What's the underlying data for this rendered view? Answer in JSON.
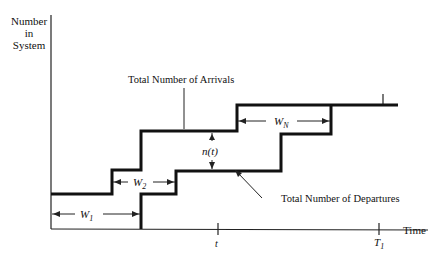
{
  "diagram": {
    "y_axis_label": [
      "Number",
      "in",
      "System"
    ],
    "x_axis_label": "Time",
    "arrivals_label": "Total Number of Arrivals",
    "departures_label": "Total Number of Departures",
    "n_label": "n(t)",
    "w1": "W",
    "w1_sub": "1",
    "w2": "W",
    "w2_sub": "2",
    "wn": "W",
    "wn_sub": "N",
    "tick_t": "t",
    "tick_T1": "T",
    "tick_T1_sub": "1"
  }
}
